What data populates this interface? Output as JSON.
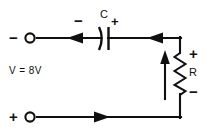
{
  "diagram": {
    "background_color": "#ffffff",
    "line_color": "#101010",
    "source": {
      "label": "V = 8V",
      "negative_terminal_sign": "−",
      "positive_terminal_sign": "+"
    },
    "capacitor": {
      "name": "C",
      "left_polarity": "−",
      "right_polarity": "+"
    },
    "resistor": {
      "name": "R",
      "top_polarity": "+",
      "bottom_polarity": "−"
    },
    "current_arrows": [
      {
        "name": "top-left-current-arrow",
        "direction": "left"
      },
      {
        "name": "top-right-current-arrow",
        "direction": "left"
      },
      {
        "name": "resistor-current-arrow",
        "direction": "up"
      },
      {
        "name": "bottom-current-arrow",
        "direction": "right"
      }
    ]
  }
}
